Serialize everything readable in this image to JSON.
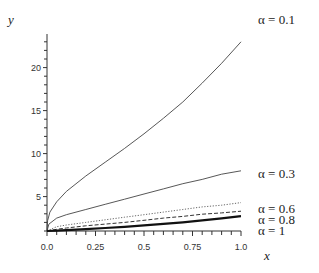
{
  "chart_data": {
    "type": "line",
    "title": "",
    "xlabel": "x",
    "ylabel": "y",
    "xlim": [
      0,
      1
    ],
    "ylim": [
      1,
      24
    ],
    "x_ticks": [
      "0.0",
      "0.25",
      "0.5",
      "0.75",
      "1.0"
    ],
    "y_ticks": [
      "5",
      "10",
      "15",
      "20"
    ],
    "grid": false,
    "legend_position": "right, labels placed at curve ends",
    "x": [
      0,
      0.05,
      0.1,
      0.2,
      0.3,
      0.4,
      0.5,
      0.6,
      0.7,
      0.8,
      0.9,
      1.0
    ],
    "series": [
      {
        "name": "α = 0.1",
        "style": "solid thin",
        "values": [
          1.0,
          4.4,
          5.6,
          7.4,
          9.0,
          10.6,
          12.3,
          14.1,
          16.0,
          18.2,
          20.5,
          23.0
        ]
      },
      {
        "name": "α = 0.3",
        "style": "solid thin",
        "values": [
          1.0,
          2.5,
          2.9,
          3.5,
          4.1,
          4.7,
          5.3,
          5.9,
          6.5,
          7.0,
          7.6,
          8.0
        ]
      },
      {
        "name": "α = 0.6",
        "style": "dotted",
        "values": [
          1.0,
          1.5,
          1.7,
          2.0,
          2.3,
          2.6,
          2.9,
          3.2,
          3.5,
          3.8,
          4.0,
          4.3
        ]
      },
      {
        "name": "α = 0.8",
        "style": "dashed",
        "values": [
          1.0,
          1.2,
          1.35,
          1.6,
          1.8,
          2.0,
          2.25,
          2.5,
          2.7,
          2.95,
          3.1,
          3.3
        ]
      },
      {
        "name": "α = 1",
        "style": "solid thick",
        "values": [
          1.0,
          1.05,
          1.1,
          1.22,
          1.35,
          1.49,
          1.65,
          1.82,
          2.01,
          2.23,
          2.46,
          2.72
        ]
      }
    ]
  },
  "labels": {
    "y_axis": "y",
    "x_axis": "x",
    "series_labels": [
      "α = 0.1",
      "α = 0.3",
      "α = 0.6",
      "α = 0.8",
      "α = 1"
    ]
  }
}
